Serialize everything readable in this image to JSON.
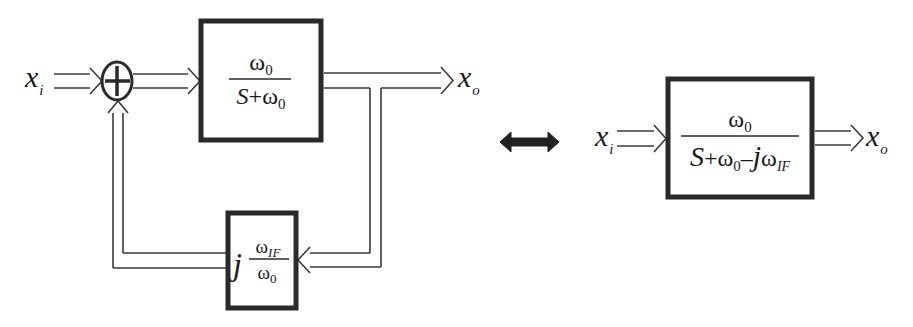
{
  "diagram": {
    "left": {
      "input_label": {
        "base": "x",
        "sub": "i"
      },
      "output_label": {
        "base": "x",
        "sub": "o"
      },
      "summing_junction": {
        "symbol": "+"
      },
      "forward_block": {
        "numerator": {
          "base": "ω",
          "sub": "0"
        },
        "denominator": {
          "s": "S",
          "plus": "+",
          "base": "ω",
          "sub": "0"
        }
      },
      "feedback_block": {
        "prefix": "j",
        "numerator": {
          "base": "ω",
          "sub": "IF"
        },
        "denominator": {
          "base": "ω",
          "sub": "0"
        }
      }
    },
    "equivalence_arrow": {
      "meaning": "equivalent-to",
      "color": "#222222"
    },
    "right": {
      "input_label": {
        "base": "x",
        "sub": "i"
      },
      "output_label": {
        "base": "x",
        "sub": "o"
      },
      "block": {
        "numerator": {
          "base": "ω",
          "sub": "0"
        },
        "denominator": {
          "s": "S",
          "plus": "+",
          "w0_base": "ω",
          "w0_sub": "0",
          "minus": "–",
          "j": "j",
          "wif_base": "ω",
          "wif_sub": "IF"
        }
      }
    },
    "colors": {
      "line": "#3a3a3a",
      "block_border": "#2a2a2a",
      "text": "#1a1a1a",
      "background": "#ffffff"
    }
  }
}
